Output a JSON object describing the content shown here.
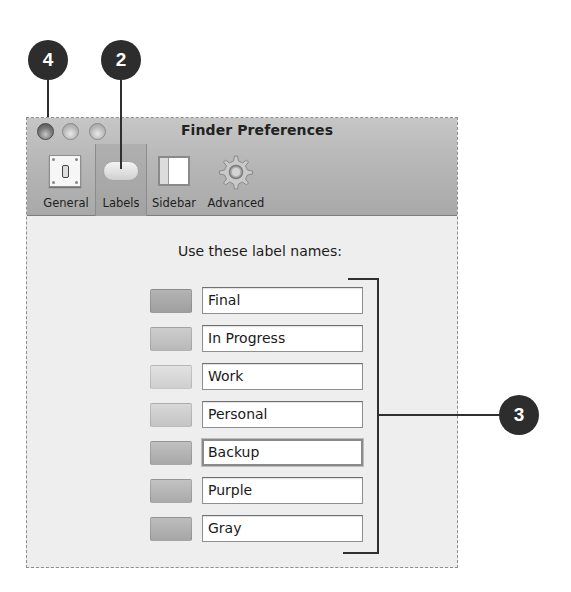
{
  "window": {
    "title": "Finder Preferences",
    "traffic_lights": [
      "close",
      "minimize",
      "zoom"
    ]
  },
  "toolbar": {
    "items": [
      {
        "label": "General",
        "icon": "light-switch-icon",
        "selected": false
      },
      {
        "label": "Labels",
        "icon": "label-pill-icon",
        "selected": true
      },
      {
        "label": "Sidebar",
        "icon": "sidebar-icon",
        "selected": false
      },
      {
        "label": "Advanced",
        "icon": "gear-icon",
        "selected": false
      }
    ]
  },
  "content": {
    "heading": "Use these label names:",
    "labels": [
      {
        "name": "Final",
        "swatch_color": "#a8a8a8",
        "focused": false
      },
      {
        "name": "In Progress",
        "swatch_color": "#c3c3c3",
        "focused": false
      },
      {
        "name": "Work",
        "swatch_color": "#d9d9d9",
        "focused": false
      },
      {
        "name": "Personal",
        "swatch_color": "#cdcdcd",
        "focused": false
      },
      {
        "name": "Backup",
        "swatch_color": "#b3b3b3",
        "focused": true
      },
      {
        "name": "Purple",
        "swatch_color": "#b6b6b6",
        "focused": false
      },
      {
        "name": "Gray",
        "swatch_color": "#b0b0b0",
        "focused": false
      }
    ]
  },
  "callouts": [
    {
      "number": "4",
      "target": "close-button"
    },
    {
      "number": "2",
      "target": "toolbar-labels"
    },
    {
      "number": "3",
      "target": "label-name-fields"
    }
  ]
}
